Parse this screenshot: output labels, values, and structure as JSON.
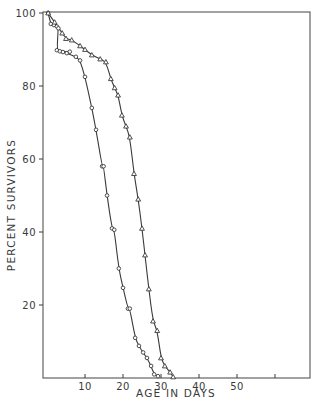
{
  "chart_data": {
    "type": "scatter",
    "title": "",
    "xlabel": "AGE IN DAYS",
    "ylabel": "PERCENT SURVIVORS",
    "xlim": [
      0,
      70
    ],
    "ylim": [
      0,
      100
    ],
    "x_ticks": [
      10,
      20,
      30,
      40,
      50,
      60
    ],
    "x_tick_labels": [
      "10",
      "20",
      "30",
      "40",
      "50",
      ""
    ],
    "y_ticks": [
      20,
      40,
      60,
      80,
      100
    ],
    "y_tick_labels": [
      "20",
      "40",
      "60",
      "80",
      "100"
    ],
    "grid": false,
    "legend": null,
    "frame": "box",
    "series": [
      {
        "name": "circles",
        "marker": "circle",
        "fit_curve": true,
        "points": [
          [
            0.3,
            100
          ],
          [
            1.0,
            97
          ],
          [
            1.8,
            96.7
          ],
          [
            2.6,
            96.3
          ],
          [
            3.0,
            95.8
          ],
          [
            2.6,
            89.8
          ],
          [
            3.4,
            89.5
          ],
          [
            4.2,
            89.3
          ],
          [
            5.2,
            89.0
          ],
          [
            6.0,
            89.4
          ],
          [
            7.6,
            88.0
          ],
          [
            8.7,
            87.0
          ],
          [
            10.0,
            82.5
          ],
          [
            11.8,
            74.0
          ],
          [
            12.9,
            68.0
          ],
          [
            14.5,
            58.0
          ],
          [
            14.9,
            58.0
          ],
          [
            15.8,
            50.0
          ],
          [
            17.1,
            41.0
          ],
          [
            17.7,
            40.6
          ],
          [
            18.9,
            30.0
          ],
          [
            20.0,
            24.7
          ],
          [
            21.3,
            19.0
          ],
          [
            21.8,
            19.0
          ],
          [
            23.2,
            11.0
          ],
          [
            24.2,
            8.8
          ],
          [
            25.3,
            7.0
          ],
          [
            26.3,
            5.5
          ],
          [
            27.4,
            3.3
          ],
          [
            28.2,
            1.0
          ],
          [
            29.2,
            0.5
          ]
        ]
      },
      {
        "name": "triangles",
        "marker": "triangle",
        "fit_curve": true,
        "points": [
          [
            0.3,
            100
          ],
          [
            2.0,
            97.5
          ],
          [
            4.0,
            94.5
          ],
          [
            5.0,
            93.0
          ],
          [
            6.5,
            92.6
          ],
          [
            8.7,
            91.0
          ],
          [
            10.0,
            90.0
          ],
          [
            11.8,
            88.5
          ],
          [
            14.0,
            87.4
          ],
          [
            15.5,
            86.6
          ],
          [
            16.8,
            82.0
          ],
          [
            17.8,
            79.5
          ],
          [
            18.7,
            77.5
          ],
          [
            19.7,
            72.0
          ],
          [
            20.8,
            69.0
          ],
          [
            21.8,
            66.0
          ],
          [
            22.9,
            56.0
          ],
          [
            24.0,
            49.0
          ],
          [
            25.0,
            41.0
          ],
          [
            25.8,
            33.7
          ],
          [
            26.8,
            24.4
          ],
          [
            27.9,
            15.6
          ],
          [
            29.0,
            13.0
          ],
          [
            30.0,
            5.5
          ],
          [
            31.0,
            3.3
          ],
          [
            32.4,
            1.6
          ],
          [
            33.2,
            0.3
          ]
        ]
      }
    ]
  },
  "layout": {
    "plot_left": 43,
    "plot_right": 310,
    "plot_top": 12,
    "plot_bottom": 378,
    "x0_px": 47,
    "px_per_day": 3.8,
    "line_color": "#3a3a3a",
    "marker_color": "#3a3a3a"
  }
}
